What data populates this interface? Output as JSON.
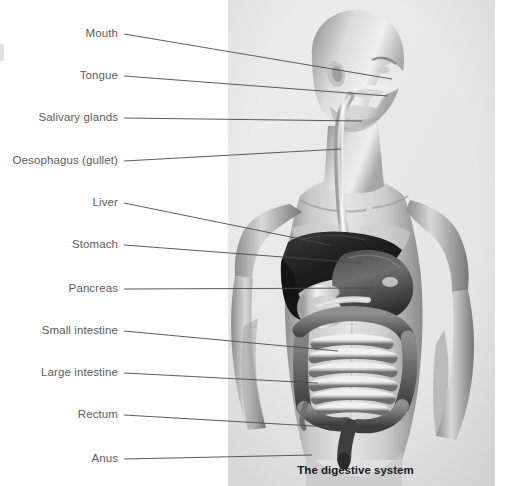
{
  "figure": {
    "caption": "The digestive system",
    "background_color": "#ffffff",
    "photo_background_color": "#e9e9e9",
    "label_color": "#5c5c5c",
    "leader_color": "#4a4a4a",
    "caption_color": "#1a1a1a"
  },
  "labels": [
    {
      "id": "mouth",
      "text": "Mouth",
      "text_right": 118,
      "text_y": 34,
      "line_x1": 124,
      "line_y1": 34,
      "line_x2": 392,
      "line_y2": 79
    },
    {
      "id": "tongue",
      "text": "Tongue",
      "text_right": 118,
      "text_y": 76,
      "line_x1": 124,
      "line_y1": 76,
      "line_x2": 388,
      "line_y2": 96
    },
    {
      "id": "salivary-glands",
      "text": "Salivary glands",
      "text_right": 118,
      "text_y": 118,
      "line_x1": 124,
      "line_y1": 118,
      "line_x2": 362,
      "line_y2": 121
    },
    {
      "id": "oesophagus",
      "text": "Oesophagus (gullet)",
      "text_right": 118,
      "text_y": 161,
      "line_x1": 124,
      "line_y1": 161,
      "line_x2": 341,
      "line_y2": 149
    },
    {
      "id": "liver",
      "text": "Liver",
      "text_right": 118,
      "text_y": 203,
      "line_x1": 124,
      "line_y1": 203,
      "line_x2": 330,
      "line_y2": 245
    },
    {
      "id": "stomach",
      "text": "Stomach",
      "text_right": 118,
      "text_y": 245,
      "line_x1": 124,
      "line_y1": 245,
      "line_x2": 362,
      "line_y2": 263
    },
    {
      "id": "pancreas",
      "text": "Pancreas",
      "text_right": 118,
      "text_y": 289,
      "line_x1": 124,
      "line_y1": 289,
      "line_x2": 374,
      "line_y2": 288
    },
    {
      "id": "small-intestine",
      "text": "Small intestine",
      "text_right": 118,
      "text_y": 331,
      "line_x1": 124,
      "line_y1": 331,
      "line_x2": 338,
      "line_y2": 351
    },
    {
      "id": "large-intestine",
      "text": "Large intestine",
      "text_right": 118,
      "text_y": 373,
      "line_x1": 124,
      "line_y1": 373,
      "line_x2": 318,
      "line_y2": 383
    },
    {
      "id": "rectum",
      "text": "Rectum",
      "text_right": 118,
      "text_y": 415,
      "line_x1": 124,
      "line_y1": 415,
      "line_x2": 330,
      "line_y2": 427
    },
    {
      "id": "anus",
      "text": "Anus",
      "text_right": 118,
      "text_y": 459,
      "line_x1": 124,
      "line_y1": 459,
      "line_x2": 312,
      "line_y2": 455
    }
  ]
}
